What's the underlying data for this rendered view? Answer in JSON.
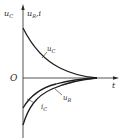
{
  "diagram": {
    "type": "rc-transient-waveforms",
    "y_axis_label": {
      "left": "u",
      "left_sub": "C",
      "right": "u",
      "right_sub": "R",
      "right_suffix": ",i"
    },
    "x_axis_label": "t",
    "origin_label": "O",
    "curves": [
      {
        "name": "u_C",
        "label": "u",
        "sub": "C",
        "shape": "exponential decay from positive value to zero"
      },
      {
        "name": "u_R",
        "label": "u",
        "sub": "R",
        "shape": "negative value rising exponentially to zero"
      },
      {
        "name": "i_C",
        "label": "i",
        "sub": "C",
        "shape": "negative value rising exponentially to zero"
      }
    ],
    "colors": {
      "axis": "#2a2a2a",
      "curve": "#1e1e1e",
      "background": "#ffffff"
    }
  }
}
